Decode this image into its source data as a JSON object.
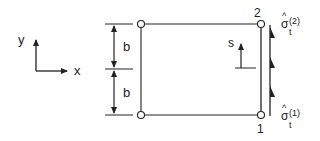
{
  "diagram": {
    "axes": {
      "x_label": "x",
      "y_label": "y"
    },
    "dimensions": {
      "upper_label": "b",
      "lower_label": "b"
    },
    "nodes": {
      "top_right": "2",
      "bottom_right": "1"
    },
    "local_coord": {
      "label": "s"
    },
    "tractions": {
      "top": {
        "symbol": "σ",
        "hat": "^",
        "subscript": "t",
        "superscript": "(2)"
      },
      "bottom": {
        "symbol": "σ",
        "hat": "^",
        "subscript": "t",
        "superscript": "(1)"
      }
    },
    "colors": {
      "ink": "#222222",
      "background": "#ffffff"
    }
  }
}
